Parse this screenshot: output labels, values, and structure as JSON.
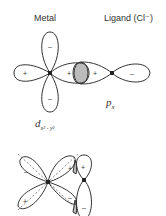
{
  "labels": {
    "metal": "Metal",
    "ligand": "Ligand (Cl⁻)",
    "ligand_orbital_main": "p",
    "ligand_orbital_sub": "x",
    "metal_orbital_main": "d",
    "metal_orbital_sub": "x² - y²"
  },
  "signs": {
    "top_metal_up": "–",
    "top_metal_down": "–",
    "top_metal_left": "+",
    "top_metal_right": "+",
    "top_ligand_left": "+",
    "top_ligand_right": "–",
    "bot_metal_ul": "–",
    "bot_metal_ur": "+",
    "bot_metal_ll": "+",
    "bot_metal_lr": "–",
    "bot_ligand_up": "+",
    "bot_ligand_down": "–"
  },
  "colors": {
    "line": "#333333",
    "hatch": "#555555",
    "dash": "#888888"
  }
}
